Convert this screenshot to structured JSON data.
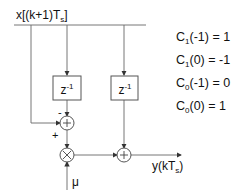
{
  "input": {
    "label_main": "x[(k+1)T",
    "label_sub": "s",
    "label_end": "]"
  },
  "output": {
    "label_main": "y(kT",
    "label_sub": "s",
    "label_end": ")"
  },
  "delay_blocks": [
    {
      "label": "z",
      "exp": "-1"
    },
    {
      "label": "z",
      "exp": "-1"
    }
  ],
  "junctions": {
    "sum1": {
      "symbol": "+",
      "minus_sign": "-",
      "plus_sign": "+"
    },
    "mult": {
      "symbol": "×"
    },
    "sum2": {
      "symbol": "+"
    }
  },
  "gain": {
    "label": "μ"
  },
  "coefficients": [
    {
      "name": "C",
      "sub": "1",
      "arg": "(-1)",
      "eq": "= 1"
    },
    {
      "name": "C",
      "sub": "1",
      "arg": "(0)",
      "eq": "= -1"
    },
    {
      "name": "C",
      "sub": "0",
      "arg": "(-1)",
      "eq": "= 0"
    },
    {
      "name": "C",
      "sub": "0",
      "arg": "(0)",
      "eq": "= 1"
    }
  ],
  "colors": {
    "line": "#555555",
    "text": "#111111"
  }
}
